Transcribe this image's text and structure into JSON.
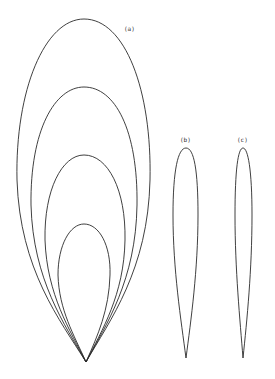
{
  "figure": {
    "labels": {
      "a": "(a)",
      "b": "(b)",
      "c": "(c)"
    },
    "panel_a": {
      "description": "Four nested teardrop/ogive curves sharing a common cusp at the bottom",
      "curves": [
        {
          "name": "outer",
          "top_y": 19,
          "width": 133
        },
        {
          "name": "second",
          "top_y": 87,
          "width": 106
        },
        {
          "name": "third",
          "top_y": 155,
          "width": 80
        },
        {
          "name": "inner",
          "top_y": 224,
          "width": 52
        }
      ],
      "cusp": {
        "x": 86,
        "y": 362
      }
    },
    "panel_b": {
      "description": "Single slender teardrop curve",
      "top_y": 148,
      "width": 25
    },
    "panel_c": {
      "description": "Single narrower slender teardrop curve",
      "top_y": 148,
      "width": 17
    }
  },
  "colors": {
    "stroke": "#2a2a2a",
    "background": "#ffffff"
  }
}
